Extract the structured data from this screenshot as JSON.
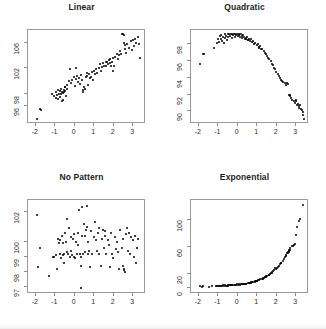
{
  "figure": {
    "layout": "2x2 grid of scatter plots",
    "background": "#ffffff",
    "point_color": "#000000",
    "axis_color": "#9a9a9a"
  },
  "chart_data": [
    {
      "type": "scatter",
      "title": "Linear",
      "xlabel": "",
      "ylabel": "",
      "xlim": [
        -2.35,
        3.6
      ],
      "ylim": [
        93.4,
        107.8
      ],
      "xticks": [
        -2,
        -1,
        0,
        1,
        2,
        3
      ],
      "yticks": [
        96,
        98,
        102,
        106
      ],
      "grid": false,
      "legend": "none",
      "x": [
        -1.92,
        -1.78,
        -1.72,
        -1.18,
        -1.05,
        -0.98,
        -0.95,
        -0.92,
        -0.88,
        -0.85,
        -0.82,
        -0.78,
        -0.75,
        -0.72,
        -0.7,
        -0.68,
        -0.65,
        -0.62,
        -0.6,
        -0.58,
        -0.55,
        -0.52,
        -0.5,
        -0.48,
        -0.45,
        -0.42,
        -0.38,
        -0.32,
        -0.25,
        -0.18,
        -0.12,
        -0.05,
        0.02,
        0.08,
        0.12,
        0.18,
        0.22,
        0.28,
        0.32,
        0.36,
        0.4,
        0.44,
        0.48,
        0.52,
        0.56,
        0.6,
        0.64,
        0.68,
        0.72,
        0.78,
        0.82,
        0.88,
        0.92,
        0.98,
        1.04,
        1.1,
        1.16,
        1.22,
        1.28,
        1.34,
        1.4,
        1.46,
        1.52,
        1.58,
        1.62,
        1.66,
        1.7,
        1.74,
        1.78,
        1.82,
        1.86,
        1.9,
        1.96,
        2.02,
        2.08,
        2.14,
        2.2,
        2.26,
        2.32,
        2.38,
        2.44,
        2.48,
        2.52,
        2.54,
        2.56,
        2.58,
        2.62,
        2.7,
        2.78,
        2.86,
        2.92,
        2.98,
        3.04,
        3.1,
        3.16,
        3.22,
        3.28,
        3.34,
        0.04,
        1.94
      ],
      "y": [
        94.0,
        95.6,
        95.4,
        97.9,
        97.6,
        98.2,
        97.3,
        97.8,
        98.6,
        97.1,
        98.0,
        98.4,
        97.4,
        98.8,
        97.9,
        96.9,
        98.3,
        98.1,
        97.0,
        98.6,
        98.2,
        99.1,
        98.4,
        99.0,
        97.6,
        98.8,
        99.4,
        100.0,
        101.8,
        99.6,
        100.2,
        100.6,
        99.2,
        100.3,
        100.8,
        99.8,
        100.4,
        99.5,
        100.9,
        100.1,
        98.3,
        98.5,
        99.0,
        98.7,
        100.6,
        101.2,
        100.8,
        99.3,
        101.0,
        100.4,
        100.6,
        101.4,
        100.2,
        101.6,
        101.0,
        101.8,
        101.2,
        102.0,
        102.6,
        101.6,
        102.2,
        102.8,
        102.4,
        103.0,
        102.3,
        102.9,
        102.6,
        103.2,
        102.8,
        103.4,
        102.4,
        103.0,
        103.6,
        102.4,
        103.8,
        104.2,
        103.4,
        104.0,
        104.6,
        104.2,
        107.3,
        107.4,
        107.2,
        106.0,
        105.6,
        105.0,
        104.4,
        105.8,
        105.2,
        106.2,
        104.8,
        106.4,
        105.4,
        106.6,
        106.0,
        106.8,
        105.8,
        103.5,
        102.0,
        101.6
      ]
    },
    {
      "type": "scatter",
      "title": "Quadratic",
      "xlabel": "",
      "ylabel": "",
      "xlim": [
        -2.35,
        3.6
      ],
      "ylim": [
        88.6,
        99.6
      ],
      "xticks": [
        -2,
        -1,
        0,
        1,
        2,
        3
      ],
      "yticks": [
        90,
        92,
        94,
        96,
        98
      ],
      "grid": false,
      "legend": "none",
      "x": [
        -1.95,
        -1.8,
        -1.74,
        -1.2,
        -1.08,
        -1.0,
        -0.96,
        -0.92,
        -0.88,
        -0.84,
        -0.8,
        -0.76,
        -0.72,
        -0.68,
        -0.64,
        -0.6,
        -0.56,
        -0.52,
        -0.48,
        -0.44,
        -0.4,
        -0.36,
        -0.32,
        -0.28,
        -0.24,
        -0.2,
        -0.16,
        -0.12,
        -0.08,
        -0.04,
        0.0,
        0.04,
        0.08,
        0.12,
        0.16,
        0.2,
        0.24,
        0.28,
        0.32,
        0.36,
        0.4,
        0.44,
        0.48,
        0.52,
        0.56,
        0.6,
        0.66,
        0.72,
        0.78,
        0.84,
        0.9,
        0.96,
        1.02,
        1.08,
        1.14,
        1.2,
        1.26,
        1.32,
        1.38,
        1.44,
        1.5,
        1.56,
        1.62,
        1.68,
        1.74,
        1.8,
        1.86,
        1.92,
        1.98,
        2.04,
        2.1,
        2.16,
        2.22,
        2.28,
        2.34,
        2.4,
        2.46,
        2.52,
        2.58,
        2.62,
        2.66,
        2.7,
        2.74,
        2.8,
        2.86,
        2.92,
        2.96,
        3.0,
        3.04,
        3.08,
        3.12,
        3.16,
        3.2,
        3.24,
        3.28,
        3.32,
        3.36,
        3.4,
        0.5,
        1.1
      ],
      "y": [
        95.7,
        96.8,
        96.9,
        97.6,
        98.2,
        98.6,
        98.3,
        99.0,
        98.7,
        99.1,
        98.4,
        98.9,
        98.2,
        99.2,
        98.8,
        99.0,
        98.5,
        99.2,
        98.9,
        99.3,
        99.0,
        99.2,
        98.8,
        99.3,
        99.1,
        99.2,
        98.9,
        99.3,
        99.1,
        99.2,
        99.0,
        99.2,
        99.1,
        98.9,
        99.2,
        99.0,
        98.8,
        99.1,
        98.9,
        98.7,
        98.8,
        98.6,
        98.9,
        98.5,
        98.7,
        98.4,
        98.6,
        98.3,
        98.4,
        98.1,
        98.2,
        97.9,
        98.0,
        97.7,
        97.8,
        97.5,
        97.4,
        97.2,
        97.0,
        96.9,
        96.6,
        96.4,
        96.2,
        96.0,
        95.7,
        95.5,
        95.2,
        95.0,
        94.7,
        94.4,
        94.2,
        94.0,
        93.8,
        93.6,
        93.5,
        93.4,
        93.2,
        93.4,
        93.3,
        92.0,
        91.9,
        91.8,
        91.6,
        91.4,
        91.2,
        91.0,
        91.4,
        91.2,
        90.8,
        90.9,
        90.6,
        90.4,
        90.7,
        90.3,
        90.1,
        89.9,
        89.6,
        89.1,
        98.5,
        97.6
      ]
    },
    {
      "type": "scatter",
      "title": "No Pattern",
      "xlabel": "",
      "ylabel": "",
      "xlim": [
        -2.35,
        3.6
      ],
      "ylim": [
        96.6,
        102.7
      ],
      "xticks": [
        -2,
        -1,
        0,
        1,
        2,
        3
      ],
      "yticks": [
        97,
        98,
        99,
        100,
        102
      ],
      "grid": false,
      "legend": "none",
      "x": [
        -1.95,
        -1.88,
        -1.8,
        -1.3,
        -1.12,
        -1.05,
        -0.98,
        -0.92,
        -0.86,
        -0.82,
        -0.78,
        -0.74,
        -0.7,
        -0.66,
        -0.62,
        -0.58,
        -0.54,
        -0.5,
        -0.46,
        -0.42,
        -0.38,
        -0.34,
        -0.3,
        -0.26,
        -0.22,
        -0.18,
        -0.14,
        -0.1,
        -0.06,
        -0.02,
        0.02,
        0.06,
        0.1,
        0.14,
        0.18,
        0.22,
        0.26,
        0.3,
        0.34,
        0.38,
        0.42,
        0.46,
        0.5,
        0.54,
        0.58,
        0.62,
        0.66,
        0.7,
        0.74,
        0.78,
        0.84,
        0.9,
        0.96,
        1.02,
        1.08,
        1.14,
        1.2,
        1.26,
        1.32,
        1.38,
        1.44,
        1.5,
        1.56,
        1.62,
        1.68,
        1.74,
        1.8,
        1.86,
        1.92,
        1.98,
        2.04,
        2.1,
        2.16,
        2.22,
        2.28,
        2.34,
        2.4,
        2.46,
        2.52,
        2.56,
        2.6,
        2.66,
        2.72,
        2.78,
        2.84,
        2.9,
        2.96,
        3.02,
        3.08,
        3.14,
        3.2,
        3.26,
        0.38,
        0.62,
        1.22,
        1.55,
        -0.62,
        2.48,
        2.5,
        0.3
      ],
      "y": [
        101.8,
        98.3,
        99.6,
        97.7,
        99.0,
        99.0,
        99.1,
        98.2,
        100.2,
        99.9,
        100.1,
        99.2,
        98.9,
        100.4,
        99.1,
        98.6,
        99.2,
        100.6,
        100.0,
        99.3,
        101.5,
        99.2,
        100.9,
        99.0,
        100.3,
        99.4,
        99.1,
        100.2,
        99.0,
        100.5,
        98.9,
        100.0,
        99.2,
        99.8,
        100.6,
        102.1,
        99.2,
        98.4,
        96.9,
        100.4,
        99.2,
        101.2,
        100.4,
        99.3,
        100.8,
        102.4,
        99.2,
        100.0,
        99.4,
        98.3,
        100.7,
        99.2,
        100.3,
        101.3,
        100.1,
        99.4,
        100.6,
        99.2,
        98.4,
        100.2,
        100.8,
        99.6,
        100.4,
        99.2,
        100.1,
        99.8,
        98.3,
        100.6,
        99.2,
        98.9,
        100.3,
        99.5,
        100.0,
        99.3,
        98.2,
        100.8,
        99.6,
        100.2,
        98.1,
        98.0,
        100.5,
        100.9,
        99.4,
        100.6,
        99.2,
        100.3,
        100.1,
        99.0,
        100.4,
        98.6,
        99.6,
        100.2,
        102.3,
        101.0,
        100.9,
        100.7,
        99.9,
        98.4,
        98.2,
        99.0
      ]
    },
    {
      "type": "scatter",
      "title": "Exponential",
      "xlabel": "",
      "ylabel": "",
      "xlim": [
        -2.35,
        3.6
      ],
      "ylim": [
        -8,
        128
      ],
      "xticks": [
        -2,
        -1,
        0,
        1,
        2,
        3
      ],
      "yticks": [
        0,
        20,
        60,
        100
      ],
      "grid": false,
      "legend": "none",
      "x": [
        -1.95,
        -1.86,
        -1.78,
        -1.3,
        -1.14,
        -1.06,
        -1.0,
        -0.94,
        -0.88,
        -0.82,
        -0.76,
        -0.7,
        -0.64,
        -0.58,
        -0.52,
        -0.46,
        -0.4,
        -0.34,
        -0.28,
        -0.22,
        -0.16,
        -0.1,
        -0.04,
        0.02,
        0.08,
        0.14,
        0.2,
        0.26,
        0.32,
        0.38,
        0.44,
        0.5,
        0.56,
        0.62,
        0.68,
        0.74,
        0.8,
        0.86,
        0.92,
        0.98,
        1.04,
        1.1,
        1.16,
        1.22,
        1.28,
        1.34,
        1.4,
        1.46,
        1.52,
        1.58,
        1.64,
        1.7,
        1.76,
        1.82,
        1.88,
        1.94,
        2.0,
        2.06,
        2.12,
        2.18,
        2.24,
        2.3,
        2.36,
        2.42,
        2.48,
        2.54,
        2.58,
        2.62,
        2.66,
        2.7,
        2.76,
        2.82,
        2.88,
        2.94,
        3.0,
        3.06,
        3.12,
        3.18,
        3.34,
        -0.6,
        -0.5,
        -0.3,
        0.1,
        0.4,
        0.7,
        1.0,
        1.3,
        1.6,
        1.9,
        2.2,
        2.45,
        2.55,
        2.6,
        2.65,
        0.55,
        1.45,
        -0.9,
        -1.5,
        0.9,
        1.75
      ],
      "y": [
        2.0,
        1.5,
        1.8,
        2.2,
        2.0,
        2.5,
        2.8,
        2.2,
        3.0,
        2.6,
        3.2,
        2.8,
        3.4,
        3.0,
        3.6,
        3.2,
        3.8,
        3.4,
        4.0,
        3.8,
        4.4,
        4.0,
        4.6,
        4.2,
        4.8,
        4.6,
        5.2,
        5.0,
        5.6,
        5.4,
        6.0,
        6.2,
        6.6,
        7.0,
        7.4,
        7.8,
        8.4,
        8.8,
        9.4,
        10.0,
        10.6,
        11.4,
        12.0,
        12.8,
        13.6,
        14.4,
        15.4,
        16.4,
        17.4,
        18.6,
        19.8,
        21.0,
        22.4,
        23.8,
        25.4,
        27.0,
        28.8,
        30.6,
        32.6,
        34.8,
        37.0,
        39.4,
        42.0,
        44.8,
        47.6,
        50.6,
        52.4,
        54.2,
        56.2,
        58.2,
        61.0,
        62.0,
        63.0,
        64.0,
        78.0,
        90.0,
        99.0,
        101.0,
        122.0,
        2.4,
        3.0,
        3.6,
        4.4,
        5.8,
        7.6,
        10.2,
        13.2,
        19.0,
        29.6,
        36.0,
        46.8,
        51.0,
        53.0,
        55.0,
        6.4,
        15.0,
        2.6,
        1.6,
        9.6,
        22.0
      ]
    }
  ]
}
